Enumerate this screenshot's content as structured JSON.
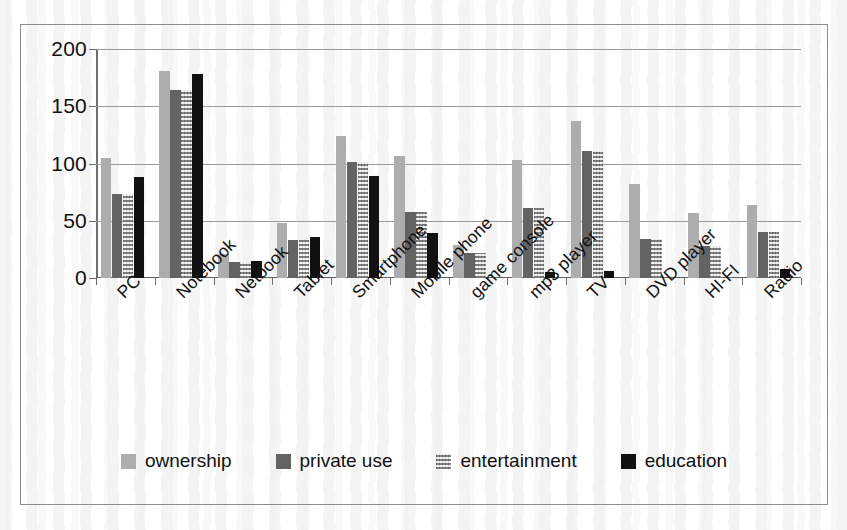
{
  "chart_data": {
    "type": "bar",
    "title": "",
    "subtitle": "",
    "xlabel": "",
    "ylabel": "",
    "ylim": [
      0,
      200
    ],
    "yticks": [
      0,
      50,
      100,
      150,
      200
    ],
    "ytick_labels": [
      "0",
      "50",
      "100",
      "150",
      "200"
    ],
    "grid": true,
    "legend_position": "bottom",
    "categories": [
      "PC",
      "Notebook",
      "Netbook",
      "Tablet",
      "Smartphone",
      "Mobile phone",
      "game console",
      "mp3 player",
      "TV",
      "DVD player",
      "HI-FI",
      "Radio"
    ],
    "series": [
      {
        "name": "ownership",
        "color": "#adadad",
        "values": [
          105,
          181,
          21,
          48,
          124,
          107,
          29,
          103,
          137,
          82,
          57,
          64
        ]
      },
      {
        "name": "private use",
        "color": "#636363",
        "values": [
          73,
          164,
          14,
          33,
          101,
          58,
          22,
          61,
          111,
          34,
          28,
          40
        ]
      },
      {
        "name": "entertainment",
        "color": "#c3c3c3",
        "values": [
          73,
          164,
          14,
          33,
          101,
          58,
          22,
          61,
          111,
          34,
          28,
          40
        ]
      },
      {
        "name": "education",
        "color": "#111111",
        "values": [
          88,
          178,
          15,
          36,
          89,
          39,
          0,
          5,
          6,
          0,
          0,
          8
        ]
      }
    ]
  }
}
